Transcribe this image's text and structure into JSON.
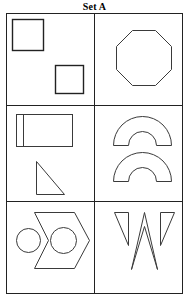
{
  "figure": {
    "title": "Set A",
    "kind": "shape-set-matrix",
    "columns": 2,
    "rows": 3,
    "stroke_color": "#3a3a3a",
    "grid_color": "#222222",
    "background_color": "#ffffff"
  },
  "grid": {
    "left": 6,
    "top": 13,
    "right": 183,
    "bottom": 294,
    "vertical_divider_x": 94,
    "horizontal_divider_y_1": 105,
    "horizontal_divider_y_2": 201
  },
  "cells": [
    {
      "id": "cell-r1c1",
      "row": 1,
      "column": 1,
      "label": "two squares",
      "shapes": [
        {
          "name": "large-square",
          "type": "square",
          "x": 12,
          "y": 19,
          "size": 31
        },
        {
          "name": "small-square",
          "type": "square",
          "x": 55,
          "y": 65,
          "size": 28
        }
      ]
    },
    {
      "id": "cell-r1c2",
      "row": 1,
      "column": 2,
      "label": "octagon",
      "shapes": [
        {
          "name": "octagon",
          "type": "octagon",
          "cx": 144,
          "cy": 57,
          "radius": 28
        }
      ]
    },
    {
      "id": "cell-r2c1",
      "row": 2,
      "column": 1,
      "label": "divided rectangle and right triangle",
      "shapes": [
        {
          "name": "divided-rectangle",
          "type": "rectangle-with-inner-line",
          "x": 16,
          "y": 114,
          "width": 56,
          "height": 32,
          "inner_line_offset": 7
        },
        {
          "name": "right-triangle",
          "type": "right-triangle",
          "x": 36,
          "y": 161,
          "width": 28,
          "height": 33
        }
      ]
    },
    {
      "id": "cell-r2c2",
      "row": 2,
      "column": 2,
      "label": "two arches",
      "shapes": [
        {
          "name": "arch-upper",
          "type": "semi-annulus",
          "cx": 142,
          "cy": 145,
          "outer_radius": 29,
          "inner_radius": 14
        },
        {
          "name": "arch-lower",
          "type": "semi-annulus",
          "cx": 142,
          "cy": 181,
          "outer_radius": 29,
          "inner_radius": 14
        }
      ]
    },
    {
      "id": "cell-r3c1",
      "row": 3,
      "column": 1,
      "label": "circle and chevron hexagon with circle",
      "shapes": [
        {
          "name": "left-circle",
          "type": "circle",
          "cx": 28,
          "cy": 240,
          "radius": 12
        },
        {
          "name": "chevron-hexagon",
          "type": "chevron-hexagon",
          "x": 34,
          "y": 212,
          "width": 56,
          "height": 57
        },
        {
          "name": "inner-circle",
          "type": "circle",
          "cx": 63,
          "cy": 240,
          "radius": 13
        }
      ]
    },
    {
      "id": "cell-r3c2",
      "row": 3,
      "column": 2,
      "label": "two outer wedges and central peak",
      "shapes": [
        {
          "name": "left-wedge",
          "type": "triangle-wedge"
        },
        {
          "name": "center-peak",
          "type": "open-peak"
        },
        {
          "name": "right-wedge",
          "type": "triangle-wedge"
        }
      ]
    }
  ]
}
